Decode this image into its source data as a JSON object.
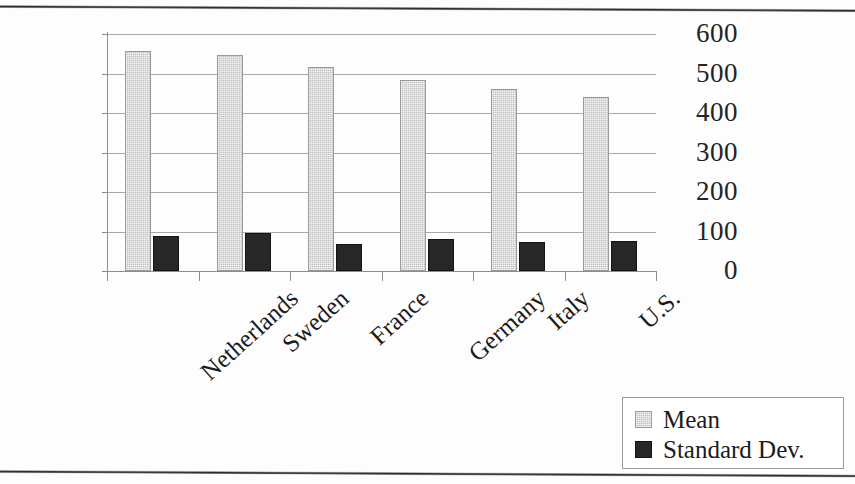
{
  "chart_data": {
    "type": "bar",
    "title": "",
    "subtitle": "",
    "xlabel": "",
    "ylabel": "",
    "categories": [
      "Netherlands",
      "Sweden",
      "France",
      "Germany",
      "Italy",
      "U.S."
    ],
    "series": [
      {
        "name": "Mean",
        "color": "#c2c2c2",
        "values": [
          558,
          546,
          516,
          483,
          460,
          441
        ]
      },
      {
        "name": "Standard Dev.",
        "color": "#272727",
        "values": [
          88,
          95,
          68,
          82,
          73,
          76
        ]
      }
    ],
    "ylim": [
      0,
      600
    ],
    "yticks": [
      0,
      100,
      200,
      300,
      400,
      500,
      600
    ],
    "ytick_labels": [
      "0",
      "100",
      "200",
      "300",
      "400",
      "500",
      "600"
    ],
    "grid": true,
    "grid_axis": "y",
    "legend": {
      "position": "bottom-right",
      "entries": [
        "Mean",
        "Standard Dev."
      ]
    },
    "annotations": []
  },
  "legend": {
    "entries": [
      {
        "label": "Mean",
        "swatch": "mean-swatch"
      },
      {
        "label": "Standard Dev.",
        "swatch": "standard-dev-swatch"
      }
    ]
  }
}
